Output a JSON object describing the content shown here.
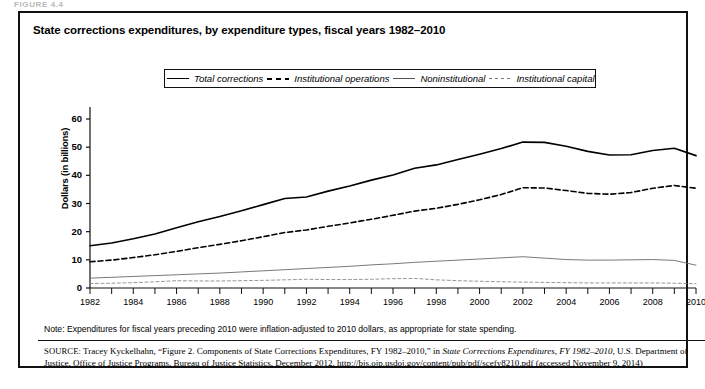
{
  "figure_tag": "FIGURE 4.4",
  "figure": {
    "title": "State corrections expenditures, by expenditure types, fiscal years 1982–2010"
  },
  "legend": {
    "position": "top-inside",
    "items": [
      {
        "label": "Total corrections",
        "style": "solid-thick",
        "color": "#000000"
      },
      {
        "label": "Institutional operations",
        "style": "dashed-thick",
        "color": "#000000"
      },
      {
        "label": "Noninstitutional",
        "style": "solid-thin",
        "color": "#555555"
      },
      {
        "label": "Institutional capital",
        "style": "dashed-thin",
        "color": "#777777"
      }
    ]
  },
  "notes": {
    "note": "Note: Expenditures for fiscal years preceding 2010 were inflation-adjusted to 2010 dollars, as appropriate for state spending.",
    "source_prefix": "SOURCE:",
    "source_part1": " Tracey Kyckelhahn, “Figure 2. Components of State Corrections Expenditures, FY 1982–2010,” in ",
    "source_italic": "State Corrections Expenditures, FY 1982–2010",
    "source_part2": ", U.S. Department of Justice, Office of Justice Programs, Bureau of Justice Statistics, December 2012, http://bjs.ojp.usdoj.gov/content/pub/pdf/scefy8210.pdf (accessed November 9, 2014)"
  },
  "chart_data": {
    "type": "line",
    "title": "State corrections expenditures, by expenditure types, fiscal years 1982–2010",
    "xlabel": "",
    "ylabel": "Dollars (in billions)",
    "xlim": [
      1982,
      2010
    ],
    "ylim": [
      0,
      60
    ],
    "yticks": [
      0,
      10,
      20,
      30,
      40,
      50,
      60
    ],
    "xticks": [
      1982,
      1984,
      1986,
      1988,
      1990,
      1992,
      1994,
      1996,
      1998,
      2000,
      2002,
      2004,
      2006,
      2008,
      2010
    ],
    "grid": false,
    "x": [
      1982,
      1983,
      1984,
      1985,
      1986,
      1987,
      1988,
      1989,
      1990,
      1991,
      1992,
      1993,
      1994,
      1995,
      1996,
      1997,
      1998,
      1999,
      2000,
      2001,
      2002,
      2003,
      2004,
      2005,
      2006,
      2007,
      2008,
      2009,
      2010
    ],
    "series": [
      {
        "name": "Total corrections",
        "style": "solid-thick",
        "values": [
          15.0,
          16.0,
          17.5,
          19.2,
          21.4,
          23.5,
          25.4,
          27.4,
          29.6,
          31.8,
          32.3,
          34.4,
          36.2,
          38.3,
          40.1,
          42.5,
          43.7,
          45.6,
          47.5,
          49.5,
          51.8,
          51.7,
          50.3,
          48.5,
          47.2,
          47.3,
          48.8,
          49.6,
          47.0
        ]
      },
      {
        "name": "Institutional operations",
        "style": "dashed-thick",
        "values": [
          9.3,
          9.9,
          10.8,
          11.8,
          13.0,
          14.3,
          15.5,
          16.8,
          18.2,
          19.7,
          20.6,
          21.9,
          23.1,
          24.4,
          25.8,
          27.3,
          28.3,
          29.7,
          31.3,
          33.2,
          35.6,
          35.5,
          34.6,
          33.6,
          33.3,
          33.9,
          35.4,
          36.4,
          35.4
        ]
      },
      {
        "name": "Noninstitutional",
        "style": "solid-thin",
        "values": [
          3.5,
          3.8,
          4.1,
          4.4,
          4.7,
          5.0,
          5.3,
          5.7,
          6.1,
          6.5,
          6.9,
          7.3,
          7.7,
          8.2,
          8.6,
          9.1,
          9.5,
          9.9,
          10.3,
          10.7,
          11.1,
          10.6,
          10.1,
          9.9,
          9.9,
          10.0,
          10.1,
          9.8,
          8.1
        ]
      },
      {
        "name": "Institutional capital",
        "style": "dashed-thin",
        "values": [
          1.6,
          1.7,
          1.9,
          2.2,
          2.6,
          2.5,
          2.5,
          2.6,
          2.7,
          2.9,
          3.1,
          3.0,
          3.0,
          3.1,
          3.3,
          3.4,
          2.9,
          2.6,
          2.4,
          2.2,
          2.1,
          2.0,
          1.9,
          1.8,
          1.8,
          1.8,
          1.8,
          1.7,
          1.5
        ]
      }
    ]
  }
}
